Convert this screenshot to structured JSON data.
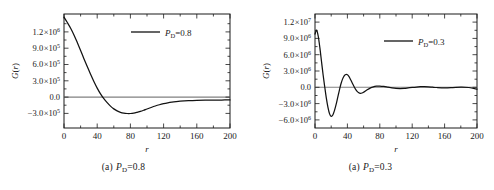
{
  "figure": {
    "panels": [
      {
        "caption_index": "(a)",
        "caption_symbol": "P",
        "caption_subscript": "D",
        "caption_value": "=0.8",
        "caption_full": "(a)  P_D=0.8",
        "legend_symbol": "P",
        "legend_subscript": "D",
        "legend_value": "=0.8",
        "legend_full": "P_D=0.8"
      },
      {
        "caption_index": "(a)",
        "caption_symbol": "P",
        "caption_subscript": "D",
        "caption_value": "=0.3",
        "caption_full": "(a)  P_D=0.3",
        "legend_symbol": "P",
        "legend_subscript": "D",
        "legend_value": "=0.3",
        "legend_full": "P_D=0.3"
      }
    ],
    "colors": {
      "curve": "#121212",
      "axis": "#1a1a1a",
      "zero_line": "#808080",
      "text": "#1a1a1a",
      "background": "#ffffff"
    }
  },
  "chart_data": [
    {
      "type": "line",
      "title": "",
      "xlabel": "r",
      "ylabel": "G(r)",
      "xlim": [
        0,
        200
      ],
      "ylim": [
        -450000,
        1350000
      ],
      "xticks": [
        0,
        40,
        80,
        120,
        160,
        200
      ],
      "xticklabels": [
        "0",
        "40",
        "80",
        "120",
        "160",
        "200"
      ],
      "yticks": [
        -300000,
        0,
        300000,
        600000,
        900000,
        1200000
      ],
      "yticklabels": [
        "-3.0×10⁵",
        "0.0",
        "3.0×10⁵",
        "6.0×10⁵",
        "9.0×10⁵",
        "1.2×10⁶"
      ],
      "grid": false,
      "legend_position": "upper-right",
      "zero_reference_line": true,
      "series": [
        {
          "name": "P_D=0.8",
          "x": [
            0,
            4,
            8,
            12,
            16,
            20,
            24,
            28,
            32,
            36,
            40,
            44,
            48,
            52,
            56,
            60,
            64,
            68,
            72,
            76,
            80,
            84,
            88,
            92,
            96,
            100,
            105,
            110,
            115,
            120,
            125,
            130,
            135,
            140,
            150,
            160,
            170,
            180,
            190,
            200
          ],
          "y": [
            1300000,
            1215000,
            1125000,
            1020000,
            900000,
            775000,
            645000,
            520000,
            400000,
            285000,
            180000,
            88000,
            12000,
            -50000,
            -105000,
            -148000,
            -180000,
            -202000,
            -215000,
            -221000,
            -221000,
            -215000,
            -203000,
            -188000,
            -170000,
            -150000,
            -126000,
            -103000,
            -83000,
            -66000,
            -52000,
            -41000,
            -33000,
            -27000,
            -19000,
            -14000,
            -11000,
            -9000,
            -8000,
            -7000
          ]
        }
      ]
    },
    {
      "type": "line",
      "title": "",
      "xlabel": "r",
      "ylabel": "G(r)",
      "xlim": [
        0,
        200
      ],
      "ylim": [
        -7500000,
        13500000
      ],
      "xticks": [
        0,
        40,
        80,
        120,
        160,
        200
      ],
      "xticklabels": [
        "0",
        "40",
        "80",
        "120",
        "160",
        "200"
      ],
      "yticks": [
        -6000000,
        -3000000,
        0,
        3000000,
        6000000,
        9000000,
        12000000
      ],
      "yticklabels": [
        "-6.0×10⁶",
        "-3.0×10⁶",
        "0.0",
        "3.0×10⁶",
        "6.0×10⁶",
        "9.0×10⁶",
        "1.2×10⁷"
      ],
      "grid": false,
      "legend_position": "upper-right",
      "zero_reference_line": true,
      "series": [
        {
          "name": "P_D=0.3",
          "x": [
            0,
            2,
            4,
            6,
            8,
            10,
            12,
            14,
            16,
            18,
            20,
            22,
            24,
            26,
            28,
            30,
            32,
            34,
            36,
            38,
            40,
            42,
            44,
            46,
            48,
            50,
            52,
            54,
            56,
            58,
            60,
            64,
            68,
            72,
            76,
            80,
            85,
            90,
            95,
            100,
            105,
            110,
            115,
            120,
            125,
            130,
            135,
            140,
            145,
            150,
            160,
            170,
            180,
            190,
            200
          ],
          "y": [
            9800000,
            10500000,
            9400000,
            7300000,
            4800000,
            2300000,
            100000,
            -2000000,
            -3700000,
            -4900000,
            -5350000,
            -5100000,
            -4300000,
            -3200000,
            -1900000,
            -600000,
            600000,
            1500000,
            2100000,
            2350000,
            2300000,
            1950000,
            1400000,
            800000,
            200000,
            -350000,
            -750000,
            -1000000,
            -1100000,
            -1050000,
            -900000,
            -500000,
            -150000,
            80000,
            200000,
            230000,
            150000,
            20000,
            -110000,
            -200000,
            -230000,
            -200000,
            -120000,
            -30000,
            50000,
            100000,
            110000,
            80000,
            20000,
            -40000,
            -110000,
            -60000,
            20000,
            -40000,
            -330000
          ]
        }
      ]
    }
  ]
}
